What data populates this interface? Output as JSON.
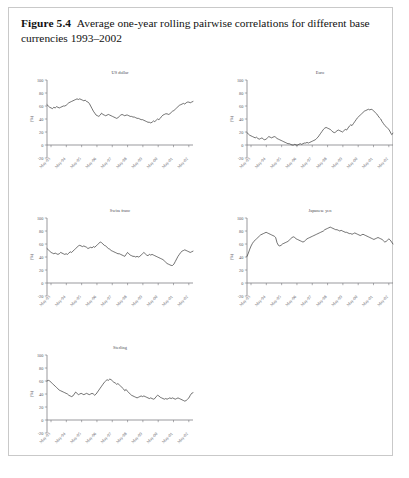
{
  "caption": {
    "figure_number": "Figure 5.4",
    "text": "Average one-year rolling pairwise correlations for different base currencies 1993–2002"
  },
  "axis": {
    "y_label": "(%)",
    "y_ticks": [
      "100",
      "80",
      "60",
      "40",
      "20",
      "0",
      "-20"
    ],
    "x_ticks": [
      "May-93",
      "May-94",
      "May-95",
      "May-96",
      "May-97",
      "May-98",
      "May-99",
      "May-00",
      "May-01",
      "May-02"
    ]
  },
  "chart_data": [
    {
      "type": "line",
      "title": "US dollar",
      "xlabel": "",
      "ylabel": "(%)",
      "ylim": [
        -20,
        100
      ],
      "grid": false,
      "legend": "none",
      "x_tick_labels": [
        "May-93",
        "May-94",
        "May-95",
        "May-96",
        "May-97",
        "May-98",
        "May-99",
        "May-00",
        "May-01",
        "May-02"
      ],
      "y_tick_values": [
        100,
        80,
        60,
        40,
        20,
        0,
        -20
      ],
      "values": [
        62,
        60,
        58,
        57,
        56,
        58,
        57,
        59,
        58,
        57,
        58,
        59,
        60,
        60,
        61,
        63,
        65,
        66,
        67,
        68,
        69,
        70,
        71,
        70,
        71,
        70,
        69,
        68,
        69,
        67,
        66,
        64,
        60,
        56,
        52,
        49,
        46,
        45,
        44,
        46,
        49,
        47,
        46,
        45,
        46,
        47,
        46,
        45,
        44,
        43,
        42,
        41,
        42,
        44,
        46,
        47,
        46,
        45,
        46,
        46,
        45,
        44,
        44,
        43,
        43,
        42,
        41,
        41,
        40,
        39,
        39,
        38,
        37,
        36,
        35,
        35,
        34,
        35,
        37,
        36,
        38,
        40,
        39,
        41,
        44,
        46,
        47,
        48,
        48,
        47,
        48,
        50,
        52,
        53,
        55,
        57,
        59,
        61,
        62,
        63,
        64,
        63,
        65,
        66,
        66,
        65,
        66,
        67
      ]
    },
    {
      "type": "line",
      "title": "Euro",
      "xlabel": "",
      "ylabel": "(%)",
      "ylim": [
        -20,
        100
      ],
      "grid": false,
      "legend": "none",
      "x_tick_labels": [
        "May-93",
        "May-94",
        "May-95",
        "May-96",
        "May-97",
        "May-98",
        "May-99",
        "May-00",
        "May-01",
        "May-02"
      ],
      "y_tick_values": [
        100,
        80,
        60,
        40,
        20,
        0,
        -20
      ],
      "values": [
        19,
        17,
        15,
        14,
        13,
        12,
        11,
        12,
        10,
        9,
        10,
        11,
        9,
        8,
        9,
        11,
        13,
        12,
        11,
        12,
        13,
        12,
        10,
        9,
        8,
        7,
        6,
        5,
        4,
        3,
        2,
        2,
        1,
        0,
        0,
        1,
        0,
        0,
        1,
        2,
        1,
        2,
        3,
        3,
        4,
        3,
        4,
        5,
        6,
        7,
        8,
        10,
        12,
        15,
        18,
        21,
        24,
        26,
        27,
        26,
        25,
        24,
        22,
        20,
        19,
        20,
        22,
        23,
        22,
        21,
        20,
        22,
        24,
        23,
        26,
        29,
        31,
        30,
        33,
        36,
        39,
        42,
        44,
        46,
        48,
        50,
        52,
        53,
        54,
        55,
        54,
        55,
        54,
        52,
        50,
        48,
        45,
        42,
        40,
        36,
        33,
        30,
        28,
        26,
        24,
        20,
        16,
        18
      ]
    },
    {
      "type": "line",
      "title": "Swiss franc",
      "xlabel": "",
      "ylabel": "(%)",
      "ylim": [
        -20,
        100
      ],
      "grid": false,
      "legend": "none",
      "x_tick_labels": [
        "May-93",
        "May-94",
        "May-95",
        "May-96",
        "May-97",
        "May-98",
        "May-99",
        "May-00",
        "May-01",
        "May-02"
      ],
      "y_tick_values": [
        100,
        80,
        60,
        40,
        20,
        0,
        -20
      ],
      "values": [
        53,
        51,
        49,
        47,
        46,
        45,
        46,
        45,
        44,
        45,
        47,
        46,
        45,
        44,
        45,
        44,
        46,
        48,
        47,
        49,
        51,
        53,
        55,
        57,
        58,
        57,
        56,
        57,
        56,
        55,
        53,
        54,
        55,
        54,
        56,
        55,
        57,
        59,
        61,
        63,
        62,
        60,
        58,
        57,
        55,
        53,
        52,
        50,
        49,
        48,
        47,
        46,
        45,
        45,
        44,
        43,
        42,
        41,
        44,
        47,
        45,
        43,
        42,
        41,
        41,
        40,
        41,
        40,
        41,
        43,
        45,
        47,
        45,
        43,
        42,
        44,
        43,
        44,
        43,
        42,
        41,
        40,
        39,
        38,
        37,
        36,
        34,
        32,
        30,
        29,
        28,
        27,
        27,
        29,
        33,
        37,
        41,
        44,
        47,
        49,
        50,
        51,
        50,
        49,
        48,
        47,
        48,
        49
      ]
    },
    {
      "type": "line",
      "title": "Japanese yen",
      "xlabel": "",
      "ylabel": "(%)",
      "ylim": [
        -20,
        100
      ],
      "grid": false,
      "legend": "none",
      "x_tick_labels": [
        "May-93",
        "May-94",
        "May-95",
        "May-96",
        "May-97",
        "May-98",
        "May-99",
        "May-00",
        "May-01",
        "May-02"
      ],
      "y_tick_values": [
        100,
        80,
        60,
        40,
        20,
        0,
        -20
      ],
      "values": [
        41,
        46,
        52,
        57,
        61,
        64,
        66,
        68,
        70,
        72,
        74,
        75,
        76,
        77,
        78,
        77,
        76,
        75,
        74,
        73,
        72,
        70,
        62,
        58,
        57,
        58,
        60,
        61,
        62,
        63,
        64,
        66,
        68,
        70,
        71,
        70,
        68,
        67,
        66,
        65,
        64,
        63,
        64,
        66,
        68,
        69,
        70,
        71,
        72,
        73,
        74,
        75,
        76,
        77,
        78,
        79,
        80,
        82,
        83,
        84,
        85,
        86,
        85,
        84,
        83,
        82,
        82,
        81,
        80,
        81,
        80,
        79,
        78,
        78,
        77,
        76,
        76,
        75,
        76,
        77,
        76,
        75,
        74,
        73,
        74,
        75,
        74,
        73,
        72,
        71,
        70,
        69,
        68,
        67,
        68,
        69,
        70,
        69,
        68,
        67,
        65,
        63,
        64,
        66,
        68,
        66,
        63,
        60
      ]
    },
    {
      "type": "line",
      "title": "Sterling",
      "xlabel": "",
      "ylabel": "(%)",
      "ylim": [
        -20,
        100
      ],
      "grid": false,
      "legend": "none",
      "x_tick_labels": [
        "May-93",
        "May-94",
        "May-95",
        "May-96",
        "May-97",
        "May-98",
        "May-99",
        "May-00",
        "May-01",
        "May-02"
      ],
      "y_tick_values": [
        100,
        80,
        60,
        40,
        20,
        0,
        -20
      ],
      "values": [
        60,
        61,
        60,
        58,
        56,
        54,
        52,
        50,
        48,
        46,
        45,
        44,
        43,
        42,
        41,
        40,
        38,
        37,
        36,
        37,
        40,
        43,
        41,
        39,
        40,
        41,
        40,
        39,
        40,
        41,
        40,
        39,
        40,
        41,
        40,
        38,
        40,
        43,
        46,
        49,
        52,
        55,
        58,
        60,
        62,
        61,
        63,
        62,
        60,
        58,
        57,
        55,
        56,
        54,
        52,
        50,
        48,
        45,
        47,
        44,
        42,
        40,
        38,
        37,
        36,
        35,
        34,
        35,
        36,
        37,
        36,
        37,
        36,
        35,
        34,
        33,
        34,
        33,
        32,
        33,
        36,
        38,
        37,
        35,
        34,
        33,
        32,
        33,
        32,
        33,
        34,
        33,
        34,
        33,
        32,
        33,
        34,
        33,
        32,
        31,
        30,
        29,
        30,
        32,
        34,
        38,
        41,
        42
      ]
    }
  ]
}
